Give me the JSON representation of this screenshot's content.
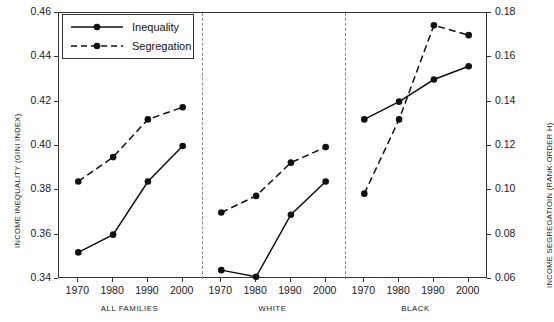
{
  "chart_data": {
    "type": "line",
    "title": "",
    "subtitle": "",
    "panels": [
      {
        "label": "ALL FAMILIES",
        "x": [
          1970,
          1980,
          1990,
          2000
        ]
      },
      {
        "label": "WHITE",
        "x": [
          1970,
          1980,
          1990,
          2000
        ]
      },
      {
        "label": "BLACK",
        "x": [
          1970,
          1980,
          1990,
          2000
        ]
      }
    ],
    "categories": [
      "1970",
      "1980",
      "1990",
      "2000"
    ],
    "series": [
      {
        "name": "Inequality",
        "axis": "left",
        "line_style": "solid",
        "marker": "filled-circle",
        "color": "#111111",
        "panel_values": {
          "ALL FAMILIES": [
            0.352,
            0.36,
            0.384,
            0.4
          ],
          "WHITE": [
            0.344,
            0.341,
            0.369,
            0.384
          ],
          "BLACK": [
            0.412,
            0.42,
            0.43,
            0.436
          ]
        }
      },
      {
        "name": "Segregation",
        "axis": "right",
        "line_style": "dashed",
        "marker": "filled-circle",
        "color": "#111111",
        "panel_values": {
          "ALL FAMILIES": [
            0.104,
            0.115,
            0.132,
            0.1375
          ],
          "WHITE": [
            0.09,
            0.0975,
            0.1125,
            0.1195
          ],
          "BLACK": [
            0.0985,
            0.132,
            0.1745,
            0.17
          ]
        }
      }
    ],
    "xlabel": "",
    "ylabel_left": "INCOME INEQUALITY (GINI INDEX)",
    "ylabel_right": "INCOME SEGREGATIOIN (RANK-ORDER H)",
    "yticks_left": [
      "0.34",
      "0.36",
      "0.38",
      "0.40",
      "0.42",
      "0.44",
      "0.46"
    ],
    "yticks_right": [
      "0.06",
      "0.08",
      "0.10",
      "0.12",
      "0.14",
      "0.16",
      "0.18"
    ],
    "ylim_left": [
      0.34,
      0.46
    ],
    "ylim_right": [
      0.06,
      0.18
    ],
    "grid": false,
    "legend_position": "top-left",
    "legend_entries": [
      "Inequality",
      "Segregation"
    ]
  },
  "legend": {
    "items": [
      {
        "label": "Inequality",
        "icon": "solid-line-marker-icon"
      },
      {
        "label": "Segregation",
        "icon": "dashed-line-marker-icon"
      }
    ]
  }
}
